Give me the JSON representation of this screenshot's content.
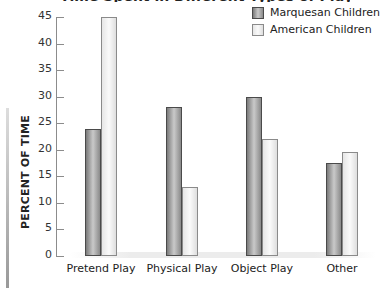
{
  "chart_data": {
    "type": "bar",
    "title": "Time spent in different types of play",
    "xlabel": "",
    "ylabel": "PERCENT OF TIME",
    "ylim": [
      0,
      45
    ],
    "yticks": [
      0,
      5,
      10,
      15,
      20,
      25,
      30,
      35,
      40,
      45
    ],
    "categories": [
      "Pretend Play",
      "Physical Play",
      "Object Play",
      "Other"
    ],
    "series": [
      {
        "name": "Marquesan Children",
        "values": [
          24,
          28,
          30,
          17.5
        ]
      },
      {
        "name": "American Children",
        "values": [
          45,
          13,
          22,
          19.5
        ]
      }
    ],
    "legend_position": "top-right",
    "grid": false
  },
  "labels": {
    "title_fragment": "Time Spent in Different Types of Play",
    "ylabel": "PERCENT OF TIME",
    "ytick_labels": [
      "0",
      "5",
      "10",
      "15",
      "20",
      "25",
      "30",
      "35",
      "40",
      "45"
    ],
    "x": [
      "Pretend Play",
      "Physical Play",
      "Object Play",
      "Other"
    ],
    "legend": [
      "Marquesan Children",
      "American Children"
    ]
  }
}
